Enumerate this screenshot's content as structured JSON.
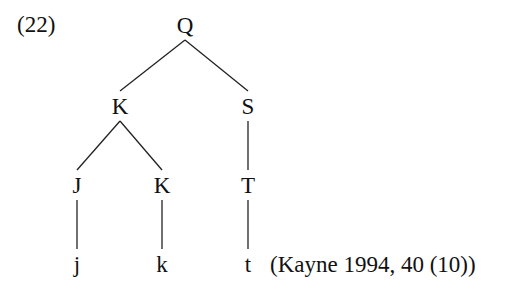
{
  "example_number": "(22)",
  "citation": "(Kayne 1994, 40 (10))",
  "tree": {
    "nodes": [
      {
        "id": "Q",
        "label": "Q"
      },
      {
        "id": "K1",
        "label": "K"
      },
      {
        "id": "S",
        "label": "S"
      },
      {
        "id": "J",
        "label": "J"
      },
      {
        "id": "K2",
        "label": "K"
      },
      {
        "id": "T",
        "label": "T"
      },
      {
        "id": "j",
        "label": "j"
      },
      {
        "id": "k",
        "label": "k"
      },
      {
        "id": "t",
        "label": "t"
      }
    ],
    "edges": [
      [
        "Q",
        "K1"
      ],
      [
        "Q",
        "S"
      ],
      [
        "K1",
        "J"
      ],
      [
        "K1",
        "K2"
      ],
      [
        "S",
        "T"
      ],
      [
        "J",
        "j"
      ],
      [
        "K2",
        "k"
      ],
      [
        "T",
        "t"
      ]
    ]
  }
}
